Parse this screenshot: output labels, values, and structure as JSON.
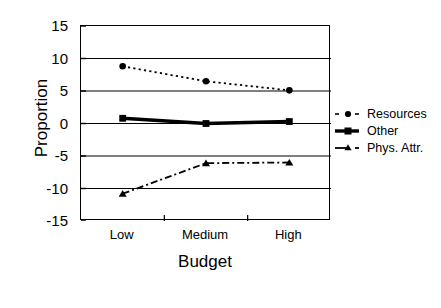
{
  "chart_data": {
    "type": "line",
    "title": "",
    "xlabel": "Budget",
    "ylabel": "Proportion",
    "categories": [
      "Low",
      "Medium",
      "High"
    ],
    "ylim": [
      -15,
      15
    ],
    "yticks": [
      15,
      10,
      5,
      0,
      -5,
      -10,
      -15
    ],
    "ytick_labels": [
      "15",
      "10",
      "5",
      "0",
      "-5",
      "-10",
      "-15"
    ],
    "grid": "horizontal",
    "legend_position": "right",
    "series": [
      {
        "name": "Resources",
        "values": [
          8.8,
          6.5,
          5.1
        ],
        "line_style": "dotted",
        "marker": "circle",
        "color": "#000000"
      },
      {
        "name": "Other",
        "values": [
          0.8,
          0.0,
          0.3
        ],
        "line_style": "solid",
        "marker": "square",
        "color": "#000000"
      },
      {
        "name": "Phys. Attr.",
        "values": [
          -10.8,
          -6.1,
          -6.0
        ],
        "line_style": "dash-dot",
        "marker": "triangle",
        "color": "#000000"
      }
    ]
  },
  "axes": {
    "y_title": "Proportion",
    "x_title": "Budget"
  }
}
